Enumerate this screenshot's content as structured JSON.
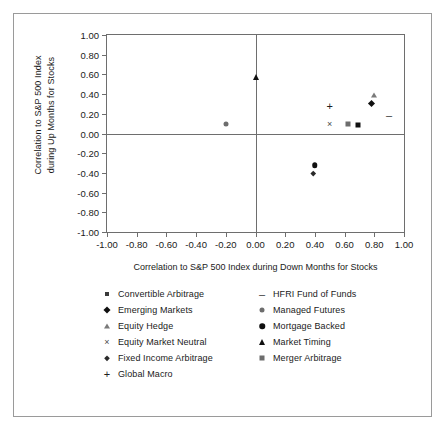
{
  "chart_data": {
    "type": "scatter",
    "title": "",
    "xlabel": "Correlation to S&P 500 Index during Down Months for Stocks",
    "ylabel_lines": [
      "Correlation to S&P 500 Index",
      "during Up Months for Stocks"
    ],
    "xlim": [
      -1.0,
      1.0
    ],
    "ylim": [
      -1.0,
      1.0
    ],
    "grid": false,
    "legend_position": "bottom",
    "xticks": [
      "-1.00",
      "-0.80",
      "-0.60",
      "-0.40",
      "-0.20",
      "0.00",
      "0.20",
      "0.40",
      "0.60",
      "0.80",
      "1.00"
    ],
    "xtick_values": [
      -1.0,
      -0.8,
      -0.6,
      -0.4,
      -0.2,
      0.0,
      0.2,
      0.4,
      0.6,
      0.8,
      1.0
    ],
    "yticks": [
      "1.00",
      "0.80",
      "0.60",
      "0.40",
      "0.20",
      "0.00",
      "-0.20",
      "-0.40",
      "-0.60",
      "-0.80",
      "-1.00"
    ],
    "ytick_values": [
      1.0,
      0.8,
      0.6,
      0.4,
      0.2,
      0.0,
      -0.2,
      -0.4,
      -0.6,
      -0.8,
      -1.0
    ],
    "points": [
      {
        "name": "Convertible Arbitrage",
        "marker": "square-black",
        "x": 0.69,
        "y": 0.09
      },
      {
        "name": "Emerging Markets",
        "marker": "diamond",
        "x": 0.8,
        "y": 0.28
      },
      {
        "name": "Equity Hedge",
        "marker": "triangle-gray",
        "x": 0.8,
        "y": 0.39
      },
      {
        "name": "Equity Market Neutral",
        "marker": "cross",
        "x": 0.5,
        "y": 0.1
      },
      {
        "name": "Fixed Income Arbitrage",
        "marker": "diamond-small",
        "x": 0.4,
        "y": -0.42
      },
      {
        "name": "Global Macro",
        "marker": "plus",
        "x": 0.5,
        "y": 0.28
      },
      {
        "name": "HFRI Fund of Funds",
        "marker": "dash",
        "x": 0.9,
        "y": 0.19
      },
      {
        "name": "Managed Futures",
        "marker": "circle-gray",
        "x": -0.2,
        "y": 0.1
      },
      {
        "name": "Mortgage Backed",
        "marker": "circle-black",
        "x": 0.4,
        "y": -0.32
      },
      {
        "name": "Market Timing",
        "marker": "triangle",
        "x": 0.0,
        "y": 0.57
      },
      {
        "name": "Merger Arbitrage",
        "marker": "square-gray",
        "x": 0.62,
        "y": 0.1
      }
    ],
    "legend": {
      "left_column": [
        {
          "label": "Convertible Arbitrage",
          "marker": "square-small"
        },
        {
          "label": "Emerging Markets",
          "marker": "diamond"
        },
        {
          "label": "Equity Hedge",
          "marker": "triangle-gray"
        },
        {
          "label": "Equity Market Neutral",
          "marker": "cross"
        },
        {
          "label": "Fixed Income Arbitrage",
          "marker": "diamond-small"
        },
        {
          "label": "Global Macro",
          "marker": "plus"
        }
      ],
      "right_column": [
        {
          "label": "HFRI Fund of Funds",
          "marker": "dash"
        },
        {
          "label": "Managed Futures",
          "marker": "circle-gray"
        },
        {
          "label": "Mortgage Backed",
          "marker": "circle-black"
        },
        {
          "label": "Market Timing",
          "marker": "triangle"
        },
        {
          "label": "Merger Arbitrage",
          "marker": "square-gray"
        }
      ]
    }
  },
  "colors": {
    "frame": "#9a9a9a",
    "axis": "#6e6e6e",
    "marker_black": "#101010",
    "marker_gray": "#6d6d6d",
    "background": "#ffffff",
    "text": "#1a1a1a"
  }
}
